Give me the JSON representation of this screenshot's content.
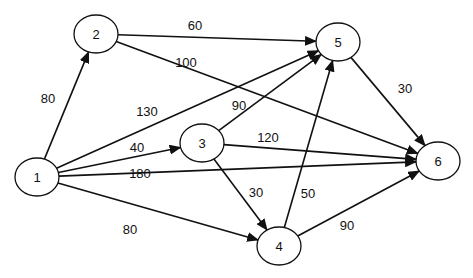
{
  "diagram": {
    "type": "directed-weighted-graph",
    "nodes": [
      {
        "id": "1",
        "label": "1",
        "x": 37,
        "y": 177
      },
      {
        "id": "2",
        "label": "2",
        "x": 96,
        "y": 34
      },
      {
        "id": "3",
        "label": "3",
        "x": 202,
        "y": 143
      },
      {
        "id": "4",
        "label": "4",
        "x": 279,
        "y": 246
      },
      {
        "id": "5",
        "label": "5",
        "x": 338,
        "y": 42
      },
      {
        "id": "6",
        "label": "6",
        "x": 438,
        "y": 161
      }
    ],
    "edges": [
      {
        "from": "1",
        "to": "2",
        "weight": "80",
        "lx": 48,
        "ly": 98
      },
      {
        "from": "1",
        "to": "5",
        "weight": "130",
        "lx": 147,
        "ly": 111
      },
      {
        "from": "1",
        "to": "3",
        "weight": "40",
        "lx": 137,
        "ly": 147
      },
      {
        "from": "1",
        "to": "6",
        "weight": "180",
        "lx": 140,
        "ly": 173
      },
      {
        "from": "1",
        "to": "4",
        "weight": "80",
        "lx": 130,
        "ly": 229
      },
      {
        "from": "2",
        "to": "5",
        "weight": "60",
        "lx": 195,
        "ly": 25
      },
      {
        "from": "2",
        "to": "6",
        "weight": "100",
        "lx": 186,
        "ly": 62
      },
      {
        "from": "3",
        "to": "5",
        "weight": "90",
        "lx": 239,
        "ly": 105
      },
      {
        "from": "3",
        "to": "6",
        "weight": "120",
        "lx": 268,
        "ly": 137
      },
      {
        "from": "3",
        "to": "4",
        "weight": "30",
        "lx": 256,
        "ly": 192
      },
      {
        "from": "4",
        "to": "5",
        "weight": "50",
        "lx": 308,
        "ly": 193
      },
      {
        "from": "4",
        "to": "6",
        "weight": "90",
        "lx": 347,
        "ly": 225
      },
      {
        "from": "5",
        "to": "6",
        "weight": "30",
        "lx": 405,
        "ly": 88
      }
    ],
    "node_rx": 22,
    "node_ry": 19,
    "stroke_color": "#111111",
    "background": "#ffffff"
  }
}
